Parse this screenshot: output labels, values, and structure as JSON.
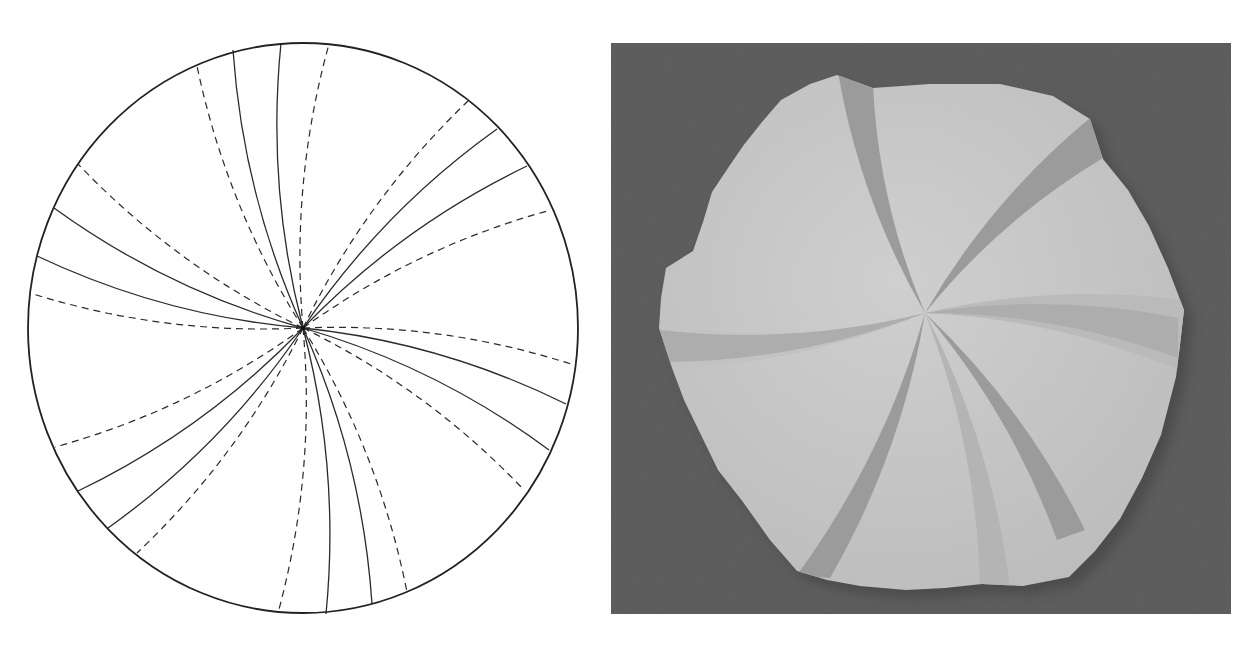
{
  "figure": {
    "left_panel": {
      "label": "Crease pattern",
      "type": "circular crease pattern with curved creases",
      "circle": {
        "cx": 303,
        "cy": 328,
        "rx": 275,
        "ry": 285,
        "stroke": "#222222"
      },
      "center": [
        303,
        328
      ],
      "curvature": 0.09,
      "line_color": "#2a2a2a",
      "creases": [
        {
          "kind": "valley",
          "end": [
            197,
            66
          ]
        },
        {
          "kind": "mountain",
          "end": [
            233,
            50
          ]
        },
        {
          "kind": "mountain",
          "end": [
            281,
            43
          ]
        },
        {
          "kind": "valley",
          "end": [
            329,
            44
          ]
        },
        {
          "kind": "valley",
          "end": [
            468,
            101
          ]
        },
        {
          "kind": "mountain",
          "end": [
            497,
            129
          ]
        },
        {
          "kind": "mountain",
          "end": [
            527,
            166
          ]
        },
        {
          "kind": "valley",
          "end": [
            551,
            210
          ]
        },
        {
          "kind": "valley",
          "end": [
            574,
            365
          ]
        },
        {
          "kind": "mountain",
          "end": [
            566,
            404
          ]
        },
        {
          "kind": "mountain",
          "end": [
            549,
            450
          ]
        },
        {
          "kind": "valley",
          "end": [
            524,
            490
          ]
        },
        {
          "kind": "valley",
          "end": [
            407,
            592
          ]
        },
        {
          "kind": "mountain",
          "end": [
            372,
            604
          ]
        },
        {
          "kind": "mountain",
          "end": [
            326,
            614
          ]
        },
        {
          "kind": "valley",
          "end": [
            278,
            613
          ]
        },
        {
          "kind": "valley",
          "end": [
            137,
            553
          ]
        },
        {
          "kind": "mountain",
          "end": [
            108,
            528
          ]
        },
        {
          "kind": "mountain",
          "end": [
            78,
            491
          ]
        },
        {
          "kind": "valley",
          "end": [
            55,
            447
          ]
        },
        {
          "kind": "valley",
          "end": [
            30,
            293
          ]
        },
        {
          "kind": "mountain",
          "end": [
            37,
            256
          ]
        },
        {
          "kind": "mountain",
          "end": [
            54,
            208
          ]
        },
        {
          "kind": "valley",
          "end": [
            78,
            164
          ]
        }
      ]
    },
    "right_panel": {
      "label": "Folded paper photograph",
      "type": "photo of the folded result",
      "frame": {
        "x": 5,
        "y": 43,
        "width": 620,
        "height": 571
      },
      "background_color": "#5f5f5f",
      "paper_color": "#c9c9c9",
      "paper_shade_color": "#bdbdbd",
      "band_color": "#9b9b9b",
      "band_light_color": "#adadad",
      "center": [
        321,
        312
      ]
    }
  }
}
